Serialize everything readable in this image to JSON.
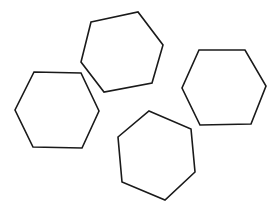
{
  "diagram": {
    "background": "#ffffff",
    "stroke_color": "#1a1a1a",
    "shapes": [
      {
        "name": "hexagon-top",
        "type": "hexagon",
        "points": "91,22 138,12 163,45 152,83 104,92 81,62"
      },
      {
        "name": "hexagon-left",
        "type": "hexagon",
        "points": "34,72 81,73 99,111 82,148 33,147 15,110"
      },
      {
        "name": "hexagon-right",
        "type": "hexagon",
        "points": "199,50 245,50 266,86 251,124 200,125 182,88"
      },
      {
        "name": "hexagon-bottom",
        "type": "hexagon",
        "points": "149,111 191,129 195,172 165,200 122,182 118,137"
      }
    ]
  }
}
